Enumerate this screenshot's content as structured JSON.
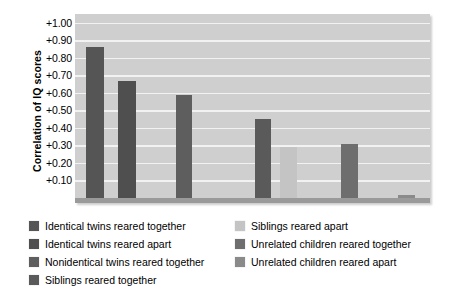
{
  "chart_data": {
    "type": "bar",
    "title": "",
    "xlabel": "",
    "ylabel": "Correlation of IQ scores",
    "ylim": [
      0.0,
      1.05
    ],
    "grid": true,
    "legend_position": "bottom",
    "ytick_labels": [
      "+1.00",
      "+0.90",
      "+0.80",
      "+0.70",
      "+0.60",
      "+0.50",
      "+0.40",
      "+0.30",
      "+0.20",
      "+0.10"
    ],
    "ytick_values": [
      1.0,
      0.9,
      0.8,
      0.7,
      0.6,
      0.5,
      0.4,
      0.3,
      0.2,
      0.1
    ],
    "categories": [
      "Identical twins reared together",
      "Identical twins reared apart",
      "Nonidentical twins reared together",
      "Siblings reared together",
      "Siblings reared apart",
      "Unrelated children reared together",
      "Unrelated children reared apart"
    ],
    "values": [
      0.86,
      0.67,
      0.59,
      0.45,
      0.29,
      0.31,
      0.02
    ],
    "colors": [
      "#555555",
      "#4f4f4f",
      "#5e5e5e",
      "#5a5a5a",
      "#c4c4c4",
      "#6e6e6e",
      "#8a8a8a"
    ]
  },
  "legend": {
    "items": [
      {
        "label": "Identical twins reared together",
        "color": "#555555",
        "column": 1
      },
      {
        "label": "Identical twins reared apart",
        "color": "#4f4f4f",
        "column": 1
      },
      {
        "label": "Nonidentical twins reared together",
        "color": "#5e5e5e",
        "column": 1
      },
      {
        "label": "Siblings reared together",
        "color": "#5a5a5a",
        "column": 1
      },
      {
        "label": "Siblings reared apart",
        "color": "#c4c4c4",
        "column": 2
      },
      {
        "label": "Unrelated children reared together",
        "color": "#6e6e6e",
        "column": 2
      },
      {
        "label": "Unrelated children reared apart",
        "color": "#8a8a8a",
        "column": 2
      }
    ]
  },
  "style": {
    "plot_background": "#cfcfcf",
    "gridline_color": "#f2f2f2",
    "baseline_color": "#9a9a9a",
    "page_background": "#ffffff"
  }
}
